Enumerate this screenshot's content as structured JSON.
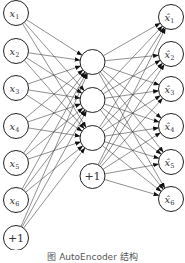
{
  "diagram": {
    "type": "autoencoder-network",
    "layers": [
      {
        "name": "input",
        "cx": 16,
        "r": 12.5,
        "nodes": [
          {
            "label": "x",
            "sub": "1",
            "cy": 13
          },
          {
            "label": "x",
            "sub": "2",
            "cy": 51
          },
          {
            "label": "x",
            "sub": "3",
            "cy": 88
          },
          {
            "label": "x",
            "sub": "4",
            "cy": 126
          },
          {
            "label": "x",
            "sub": "5",
            "cy": 163
          },
          {
            "label": "x",
            "sub": "6",
            "cy": 200
          },
          {
            "label": "+1",
            "sub": "",
            "cy": 238,
            "bias": true
          }
        ]
      },
      {
        "name": "hidden",
        "cx": 92.5,
        "r": 12.5,
        "nodes": [
          {
            "label": "",
            "sub": "",
            "cy": 62
          },
          {
            "label": "",
            "sub": "",
            "cy": 100
          },
          {
            "label": "",
            "sub": "",
            "cy": 138
          },
          {
            "label": "+1",
            "sub": "",
            "cy": 176,
            "bias": true
          }
        ]
      },
      {
        "name": "output",
        "cx": 171,
        "r": 12.5,
        "nodes": [
          {
            "label": "x̂",
            "sub": "1",
            "cy": 17
          },
          {
            "label": "x̂",
            "sub": "2",
            "cy": 54
          },
          {
            "label": "x̂",
            "sub": "3",
            "cy": 89
          },
          {
            "label": "x̂",
            "sub": "4",
            "cy": 126
          },
          {
            "label": "x̂",
            "sub": "5",
            "cy": 162
          },
          {
            "label": "x̂",
            "sub": "6",
            "cy": 199
          }
        ]
      }
    ],
    "colors": {
      "stroke": "#222222",
      "edge": "#333333",
      "text": "#333333",
      "background": "#ffffff"
    }
  },
  "caption": "图  AutoEncoder 结构"
}
